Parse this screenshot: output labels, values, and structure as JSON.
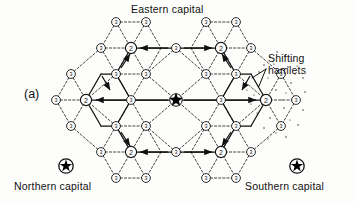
{
  "figure": {
    "panel_label": "(a)",
    "labels": {
      "eastern_capital": "Eastern capital",
      "northern_capital": "Northern capital",
      "southern_capital": "Southern capital",
      "shifting_hamlets": "Shifting\nhamlets"
    },
    "colors": {
      "ink": "#111111",
      "paper": "#fdfdfb",
      "node_fill": "#ffffff",
      "star_fill": "#000000"
    },
    "legend_symbols": {
      "capital": "filled-star-in-circle",
      "order2_town": "circle-with-2",
      "order3_hamlet": "circle-with-3",
      "center": "filled-star"
    }
  },
  "chart_data": {
    "type": "scatter",
    "title": "Eastern capital",
    "xlabel": "",
    "ylabel": "",
    "grid": false,
    "legend_position": "none",
    "annotations": [
      {
        "text": "(a)",
        "x": 30,
        "y": 96
      },
      {
        "text": "Eastern capital",
        "x": 176,
        "y": 10
      },
      {
        "text": "Shifting hamlets",
        "x": 300,
        "y": 64
      },
      {
        "text": "Northern capital",
        "x": 56,
        "y": 190
      },
      {
        "text": "Southern capital",
        "x": 290,
        "y": 190
      }
    ],
    "nodes": [
      {
        "id": "center",
        "label": "★",
        "rank": 1,
        "x": 176,
        "y": 100,
        "kind": "capital-star"
      },
      {
        "id": "t-nw",
        "label": "2",
        "rank": 2,
        "x": 131,
        "y": 48,
        "kind": "town"
      },
      {
        "id": "t-ne",
        "label": "2",
        "rank": 2,
        "x": 221,
        "y": 48,
        "kind": "town"
      },
      {
        "id": "t-w",
        "label": "2",
        "rank": 2,
        "x": 86,
        "y": 100,
        "kind": "town"
      },
      {
        "id": "t-e",
        "label": "2",
        "rank": 2,
        "x": 266,
        "y": 100,
        "kind": "town"
      },
      {
        "id": "t-sw",
        "label": "2",
        "rank": 2,
        "x": 131,
        "y": 152,
        "kind": "town"
      },
      {
        "id": "t-se",
        "label": "2",
        "rank": 2,
        "x": 221,
        "y": 152,
        "kind": "town"
      },
      {
        "id": "h-01",
        "label": "3",
        "rank": 3,
        "x": 116,
        "y": 22,
        "kind": "hamlet"
      },
      {
        "id": "h-02",
        "label": "3",
        "rank": 3,
        "x": 146,
        "y": 22,
        "kind": "hamlet"
      },
      {
        "id": "h-03",
        "label": "3",
        "rank": 3,
        "x": 206,
        "y": 22,
        "kind": "hamlet"
      },
      {
        "id": "h-04",
        "label": "3",
        "rank": 3,
        "x": 236,
        "y": 22,
        "kind": "hamlet"
      },
      {
        "id": "h-05",
        "label": "3",
        "rank": 3,
        "x": 101,
        "y": 48,
        "kind": "hamlet"
      },
      {
        "id": "h-06",
        "label": "3",
        "rank": 3,
        "x": 176,
        "y": 48,
        "kind": "hamlet"
      },
      {
        "id": "h-07",
        "label": "3",
        "rank": 3,
        "x": 251,
        "y": 48,
        "kind": "hamlet"
      },
      {
        "id": "h-08",
        "label": "3",
        "rank": 3,
        "x": 116,
        "y": 74,
        "kind": "hamlet"
      },
      {
        "id": "h-09",
        "label": "3",
        "rank": 3,
        "x": 146,
        "y": 74,
        "kind": "hamlet"
      },
      {
        "id": "h-10",
        "label": "3",
        "rank": 3,
        "x": 206,
        "y": 74,
        "kind": "hamlet"
      },
      {
        "id": "h-11",
        "label": "3",
        "rank": 3,
        "x": 236,
        "y": 74,
        "kind": "hamlet"
      },
      {
        "id": "h-12",
        "label": "3",
        "rank": 3,
        "x": 71,
        "y": 74,
        "kind": "hamlet"
      },
      {
        "id": "h-13",
        "label": "3",
        "rank": 3,
        "x": 281,
        "y": 74,
        "kind": "hamlet",
        "shifting": true
      },
      {
        "id": "h-14",
        "label": "3",
        "rank": 3,
        "x": 56,
        "y": 100,
        "kind": "hamlet"
      },
      {
        "id": "h-15",
        "label": "3",
        "rank": 3,
        "x": 131,
        "y": 100,
        "kind": "hamlet"
      },
      {
        "id": "h-16",
        "label": "3",
        "rank": 3,
        "x": 221,
        "y": 100,
        "kind": "hamlet"
      },
      {
        "id": "h-17",
        "label": "3",
        "rank": 3,
        "x": 296,
        "y": 100,
        "kind": "hamlet",
        "shifting": true
      },
      {
        "id": "h-18",
        "label": "3",
        "rank": 3,
        "x": 71,
        "y": 126,
        "kind": "hamlet"
      },
      {
        "id": "h-19",
        "label": "3",
        "rank": 3,
        "x": 281,
        "y": 126,
        "kind": "hamlet",
        "shifting": true
      },
      {
        "id": "h-20",
        "label": "3",
        "rank": 3,
        "x": 116,
        "y": 126,
        "kind": "hamlet"
      },
      {
        "id": "h-21",
        "label": "3",
        "rank": 3,
        "x": 146,
        "y": 126,
        "kind": "hamlet"
      },
      {
        "id": "h-22",
        "label": "3",
        "rank": 3,
        "x": 206,
        "y": 126,
        "kind": "hamlet"
      },
      {
        "id": "h-23",
        "label": "3",
        "rank": 3,
        "x": 236,
        "y": 126,
        "kind": "hamlet"
      },
      {
        "id": "h-24",
        "label": "3",
        "rank": 3,
        "x": 101,
        "y": 152,
        "kind": "hamlet"
      },
      {
        "id": "h-25",
        "label": "3",
        "rank": 3,
        "x": 176,
        "y": 152,
        "kind": "hamlet"
      },
      {
        "id": "h-26",
        "label": "3",
        "rank": 3,
        "x": 251,
        "y": 152,
        "kind": "hamlet"
      },
      {
        "id": "h-27",
        "label": "3",
        "rank": 3,
        "x": 116,
        "y": 178,
        "kind": "hamlet"
      },
      {
        "id": "h-28",
        "label": "3",
        "rank": 3,
        "x": 146,
        "y": 178,
        "kind": "hamlet"
      },
      {
        "id": "h-29",
        "label": "3",
        "rank": 3,
        "x": 206,
        "y": 178,
        "kind": "hamlet"
      },
      {
        "id": "h-30",
        "label": "3",
        "rank": 3,
        "x": 236,
        "y": 178,
        "kind": "hamlet"
      },
      {
        "id": "cap-north",
        "label": "★",
        "rank": 1,
        "x": 66,
        "y": 166,
        "kind": "capital-circled"
      },
      {
        "id": "cap-south",
        "label": "★",
        "rank": 1,
        "x": 297,
        "y": 166,
        "kind": "capital-circled"
      }
    ]
  }
}
